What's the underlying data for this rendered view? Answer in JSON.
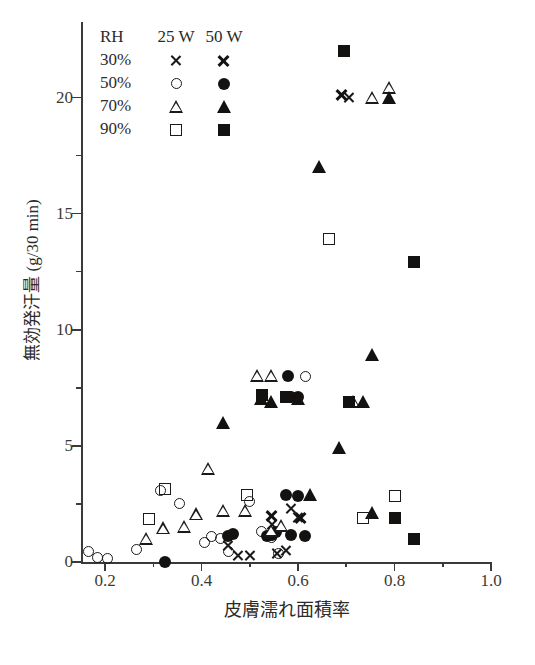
{
  "axes": {
    "x_title": "皮膚濡れ面積率",
    "y_title": "無効発汗量 (g/30 min)",
    "x_ticks": [
      "0.2",
      "0.4",
      "0.6",
      "0.8",
      "1.0"
    ],
    "y_ticks": [
      "0",
      "5",
      "10",
      "15",
      "20"
    ]
  },
  "legend": {
    "header": {
      "rh": "RH",
      "c25": "25 W",
      "c50": "50 W"
    },
    "rows": [
      {
        "rh": "30%",
        "sym25": "open-cross",
        "sym50": "filled-cross"
      },
      {
        "rh": "50%",
        "sym25": "open-circle",
        "sym50": "filled-circle"
      },
      {
        "rh": "70%",
        "sym25": "open-triangle",
        "sym50": "filled-triangle"
      },
      {
        "rh": "90%",
        "sym25": "open-square",
        "sym50": "filled-square"
      }
    ]
  },
  "chart_data": {
    "type": "scatter",
    "title": "",
    "xlabel": "皮膚濡れ面積率",
    "ylabel": "無効発汗量 (g/30 min)",
    "xlim": [
      0.15,
      1.0
    ],
    "ylim": [
      0,
      23
    ],
    "grid": false,
    "legend_position": "top-left",
    "series": [
      {
        "name": "30% RH, 25 W",
        "marker": "open-cross",
        "points": [
          [
            0.455,
            0.7
          ],
          [
            0.475,
            0.3
          ],
          [
            0.5,
            0.3
          ],
          [
            0.545,
            1.6
          ],
          [
            0.555,
            0.35
          ],
          [
            0.575,
            0.5
          ],
          [
            0.585,
            2.3
          ],
          [
            0.6,
            1.9
          ],
          [
            0.705,
            20.0
          ]
        ]
      },
      {
        "name": "30% RH, 50 W",
        "marker": "filled-cross",
        "points": [
          [
            0.545,
            2.0
          ],
          [
            0.605,
            1.9
          ],
          [
            0.69,
            20.1
          ]
        ]
      },
      {
        "name": "50% RH, 25 W",
        "marker": "open-circle",
        "points": [
          [
            0.165,
            0.45
          ],
          [
            0.185,
            0.2
          ],
          [
            0.205,
            0.15
          ],
          [
            0.265,
            0.55
          ],
          [
            0.315,
            3.1
          ],
          [
            0.355,
            2.5
          ],
          [
            0.405,
            0.85
          ],
          [
            0.42,
            1.1
          ],
          [
            0.44,
            1.0
          ],
          [
            0.455,
            0.45
          ],
          [
            0.5,
            2.6
          ],
          [
            0.525,
            1.3
          ],
          [
            0.545,
            1.05
          ],
          [
            0.56,
            0.35
          ],
          [
            0.615,
            8.0
          ]
        ]
      },
      {
        "name": "50% RH, 50 W",
        "marker": "filled-circle",
        "points": [
          [
            0.325,
            0.0
          ],
          [
            0.455,
            1.1
          ],
          [
            0.465,
            1.2
          ],
          [
            0.535,
            1.1
          ],
          [
            0.545,
            1.15
          ],
          [
            0.555,
            1.3
          ],
          [
            0.575,
            2.9
          ],
          [
            0.6,
            2.85
          ],
          [
            0.58,
            8.0
          ],
          [
            0.585,
            7.1
          ],
          [
            0.6,
            7.1
          ],
          [
            0.585,
            1.15
          ],
          [
            0.615,
            1.1
          ]
        ]
      },
      {
        "name": "70% RH, 25 W",
        "marker": "open-triangle",
        "points": [
          [
            0.285,
            1.0
          ],
          [
            0.32,
            1.45
          ],
          [
            0.365,
            1.5
          ],
          [
            0.39,
            2.05
          ],
          [
            0.415,
            4.0
          ],
          [
            0.445,
            2.2
          ],
          [
            0.49,
            2.2
          ],
          [
            0.545,
            1.35
          ],
          [
            0.565,
            1.55
          ],
          [
            0.515,
            8.0
          ],
          [
            0.545,
            8.0
          ],
          [
            0.715,
            6.9
          ],
          [
            0.755,
            20.0
          ],
          [
            0.79,
            20.4
          ]
        ]
      },
      {
        "name": "70% RH, 50 W",
        "marker": "filled-triangle",
        "points": [
          [
            0.445,
            6.0
          ],
          [
            0.525,
            7.0
          ],
          [
            0.545,
            6.9
          ],
          [
            0.6,
            7.0
          ],
          [
            0.625,
            2.9
          ],
          [
            0.645,
            17.0
          ],
          [
            0.685,
            4.9
          ],
          [
            0.735,
            6.9
          ],
          [
            0.755,
            8.9
          ],
          [
            0.79,
            20.0
          ],
          [
            0.755,
            2.1
          ]
        ]
      },
      {
        "name": "90% RH, 25 W",
        "marker": "open-square",
        "points": [
          [
            0.29,
            1.85
          ],
          [
            0.325,
            3.15
          ],
          [
            0.495,
            2.9
          ],
          [
            0.665,
            13.9
          ],
          [
            0.735,
            1.9
          ],
          [
            0.8,
            2.85
          ]
        ]
      },
      {
        "name": "90% RH, 50 W",
        "marker": "filled-square",
        "points": [
          [
            0.525,
            7.2
          ],
          [
            0.575,
            7.1
          ],
          [
            0.705,
            6.9
          ],
          [
            0.695,
            22.0
          ],
          [
            0.8,
            1.9
          ],
          [
            0.84,
            12.9
          ],
          [
            0.84,
            1.0
          ]
        ]
      }
    ]
  }
}
